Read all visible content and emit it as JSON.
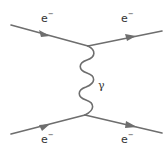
{
  "diagram": {
    "type": "feynman",
    "title": "",
    "line_color": "#6e6e6e",
    "text_color": "#333333",
    "vertices": [
      {
        "id": "v_top",
        "x": 88,
        "y": 46
      },
      {
        "id": "v_bottom",
        "x": 85,
        "y": 115
      }
    ],
    "fermion_lines": [
      {
        "id": "incoming_top",
        "from": [
          11,
          25
        ],
        "to": [
          88,
          46
        ],
        "arrow": true,
        "label": "e",
        "charge": "−"
      },
      {
        "id": "outgoing_top",
        "from": [
          88,
          46
        ],
        "to": [
          162,
          31
        ],
        "arrow": true,
        "label": "e",
        "charge": "−"
      },
      {
        "id": "incoming_bottom",
        "from": [
          11,
          134
        ],
        "to": [
          85,
          115
        ],
        "arrow": true,
        "label": "e",
        "charge": "−"
      },
      {
        "id": "outgoing_bottom",
        "from": [
          85,
          115
        ],
        "to": [
          162,
          133
        ],
        "arrow": true,
        "label": "e",
        "charge": "−"
      }
    ],
    "boson_lines": [
      {
        "id": "photon",
        "from": [
          88,
          46
        ],
        "to": [
          85,
          115
        ],
        "style": "wavy",
        "label": "γ"
      }
    ],
    "labels": {
      "top_left": {
        "base": "e",
        "sup": "−"
      },
      "top_right": {
        "base": "e",
        "sup": "−"
      },
      "bottom_left": {
        "base": "e",
        "sup": "−"
      },
      "bottom_right": {
        "base": "e",
        "sup": "−"
      },
      "photon": "γ"
    }
  }
}
